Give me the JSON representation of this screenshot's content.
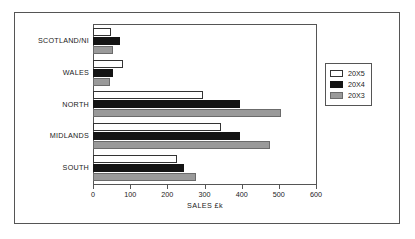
{
  "chart_data": {
    "type": "bar",
    "orientation": "horizontal",
    "title": "",
    "xlabel": "SALES £k",
    "ylabel": "",
    "categories": [
      "SCOTLAND/NI",
      "WALES",
      "NORTH",
      "MIDLANDS",
      "SOUTH"
    ],
    "series": [
      {
        "name": "20X5",
        "color": "#ffffff",
        "values": [
          48,
          80,
          295,
          345,
          225
        ]
      },
      {
        "name": "20X4",
        "color": "#141414",
        "values": [
          72,
          55,
          395,
          395,
          245
        ]
      },
      {
        "name": "20X3",
        "color": "#9a9a9a",
        "values": [
          55,
          45,
          505,
          475,
          277
        ]
      }
    ],
    "xlim": [
      0,
      600
    ],
    "xticks": [
      0,
      100,
      200,
      300,
      400,
      500,
      600
    ],
    "xtick_labels": [
      "0",
      "100",
      "200",
      "300",
      "400",
      "500",
      "600"
    ],
    "grid": false,
    "legend_position": "right"
  },
  "legend": {
    "items": [
      {
        "label": "20X5"
      },
      {
        "label": "20X4"
      },
      {
        "label": "20X3"
      }
    ]
  }
}
